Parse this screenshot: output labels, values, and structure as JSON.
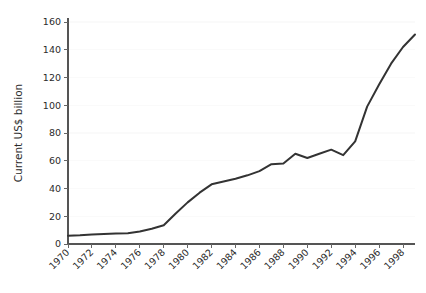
{
  "chart_data": {
    "type": "line",
    "title": "",
    "xlabel": "",
    "ylabel": "Current US$ billion",
    "xlim": [
      1970,
      1999
    ],
    "ylim": [
      0,
      160
    ],
    "grid": true,
    "legend": "none",
    "line_color": "#333333",
    "x_tick_labels": [
      "1970",
      "1972",
      "1974",
      "1976",
      "1978",
      "1980",
      "1982",
      "1984",
      "1986",
      "1988",
      "1990",
      "1992",
      "1994",
      "1996",
      "1998"
    ],
    "x_ticks": [
      1970,
      1972,
      1974,
      1976,
      1978,
      1980,
      1982,
      1984,
      1986,
      1988,
      1990,
      1992,
      1994,
      1996,
      1998
    ],
    "y_tick_labels": [
      "0",
      "20",
      "40",
      "60",
      "80",
      "100",
      "120",
      "140",
      "160"
    ],
    "y_ticks": [
      0,
      20,
      40,
      60,
      80,
      100,
      120,
      140,
      160
    ],
    "x": [
      1970,
      1971,
      1972,
      1973,
      1974,
      1975,
      1976,
      1977,
      1978,
      1979,
      1980,
      1981,
      1982,
      1983,
      1984,
      1985,
      1986,
      1987,
      1988,
      1989,
      1990,
      1991,
      1992,
      1993,
      1994,
      1995,
      1996,
      1997,
      1998,
      1999
    ],
    "series": [
      {
        "name": "Current US$ billion",
        "values": [
          6,
          6.3,
          6.8,
          7.2,
          7.5,
          7.8,
          9,
          11,
          13.5,
          22,
          30,
          37,
          43,
          45,
          47,
          49.5,
          52.5,
          57.5,
          58,
          65,
          62,
          65,
          68,
          64,
          74,
          99,
          115,
          130,
          142,
          151
        ]
      }
    ]
  }
}
